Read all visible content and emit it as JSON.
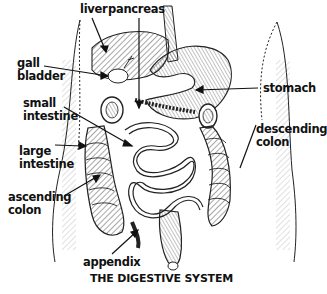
{
  "title": "THE DIGESTIVE SYSTEM",
  "labels": {
    "liver": "liver",
    "pancreas": "pancreas",
    "gall_bladder": "gall\nbladder",
    "small_intestine": "small\nintestine",
    "stomach": "stomach",
    "descending_colon": "descending\ncolon",
    "large_intestine": "large\nintestine",
    "ascending_colon": "ascending\ncolon",
    "appendix": "appendix"
  },
  "colors": {
    "ink": "#111111",
    "background": "#ffffff"
  }
}
